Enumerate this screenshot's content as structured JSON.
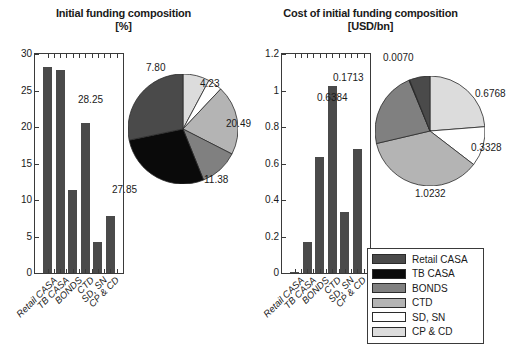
{
  "figure": {
    "width": 494,
    "height": 355,
    "background": "#ffffff"
  },
  "legend": {
    "name": "funding-category-legend",
    "position": "bottom-right",
    "entries": [
      {
        "label": "Retail CASA",
        "color": "#4a4a4a"
      },
      {
        "label": "TB CASA",
        "color": "#0a0a0a"
      },
      {
        "label": "BONDS",
        "color": "#808080"
      },
      {
        "label": "CTD",
        "color": "#b4b4b4"
      },
      {
        "label": "SD, SN",
        "color": "#ffffff"
      },
      {
        "label": "CP & CD",
        "color": "#dcdcdc"
      }
    ]
  },
  "chart_data": [
    {
      "id": "initial-funding-bar",
      "type": "bar",
      "title": "Initial funding composition",
      "subtitle": "[%]",
      "xlabel": "",
      "ylabel": "",
      "ylim": [
        0,
        30
      ],
      "yticks": [
        0,
        5,
        10,
        15,
        20,
        25,
        30
      ],
      "ytick_labels": [
        "0",
        "5",
        "10",
        "15",
        "20",
        "25",
        "30"
      ],
      "grid": false,
      "bar_color": "#4a4a4a",
      "categories": [
        "Retail CASA",
        "TB CASA",
        "BONDS",
        "CTD",
        "SD, SN",
        "CP & CD"
      ],
      "values": [
        28.25,
        27.85,
        11.38,
        20.49,
        4.23,
        7.8
      ]
    },
    {
      "id": "initial-funding-pie",
      "type": "pie",
      "title": "",
      "unit": "%",
      "labels": [
        "Retail CASA",
        "TB CASA",
        "BONDS",
        "CTD",
        "SD, SN",
        "CP & CD"
      ],
      "values": [
        28.25,
        27.85,
        11.38,
        20.49,
        4.23,
        7.8
      ],
      "value_labels": [
        "28.25",
        "27.85",
        "11.38",
        "20.49",
        "4.23",
        "7.80"
      ],
      "colors": [
        "#4a4a4a",
        "#0a0a0a",
        "#808080",
        "#b4b4b4",
        "#ffffff",
        "#dcdcdc"
      ],
      "start_angle_deg": 90,
      "direction": "counterclockwise"
    },
    {
      "id": "cost-of-funding-bar",
      "type": "bar",
      "title": "Cost of initial funding composition",
      "subtitle": "[USD/bn]",
      "xlabel": "",
      "ylabel": "",
      "ylim": [
        0,
        1.2
      ],
      "yticks": [
        0,
        0.2,
        0.4,
        0.6,
        0.8,
        1,
        1.2
      ],
      "ytick_labels": [
        "0",
        "0.2",
        "0.4",
        "0.6",
        "0.8",
        "1",
        "1.2"
      ],
      "grid": false,
      "bar_color": "#4a4a4a",
      "categories": [
        "Retail CASA",
        "TB CASA",
        "BONDS",
        "CTD",
        "SD, SN",
        "CP & CD"
      ],
      "values": [
        0.007,
        0.1713,
        0.6384,
        1.0232,
        0.3328,
        0.6768
      ]
    },
    {
      "id": "cost-of-funding-pie",
      "type": "pie",
      "title": "",
      "unit": "USD/bn",
      "labels": [
        "Retail CASA",
        "TB CASA",
        "BONDS",
        "CTD",
        "SD, SN",
        "CP & CD"
      ],
      "values": [
        0.007,
        0.1713,
        0.6384,
        1.0232,
        0.3328,
        0.6768
      ],
      "value_labels": [
        "0.0070",
        "0.1713",
        "0.6384",
        "1.0232",
        "0.3328",
        "0.6768"
      ],
      "colors": [
        "#4a4a4a",
        "#0a0a0a",
        "#808080",
        "#b4b4b4",
        "#ffffff",
        "#dcdcdc"
      ],
      "start_angle_deg": 90,
      "direction": "counterclockwise"
    }
  ]
}
